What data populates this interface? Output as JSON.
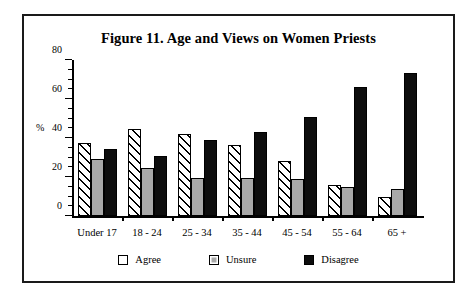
{
  "chart_data": {
    "type": "bar",
    "title": "Figure 11. Age and Views on Women Priests",
    "xlabel": "",
    "ylabel": "%",
    "ylim": [
      0,
      80
    ],
    "yticks": [
      0,
      20,
      40,
      60,
      80
    ],
    "ytick_labels": [
      "0",
      "20",
      "40",
      "60",
      "80"
    ],
    "grid": false,
    "legend_position": "bottom",
    "categories": [
      "Under 17",
      "18 - 24",
      "25 - 34",
      "35 - 44",
      "45 - 54",
      "55 - 64",
      "65 +"
    ],
    "series": [
      {
        "name": "Agree",
        "values": [
          37.5,
          44.5,
          42.0,
          36.5,
          28.0,
          16.0,
          9.5
        ]
      },
      {
        "name": "Unsure",
        "values": [
          29.0,
          24.5,
          19.5,
          19.5,
          19.0,
          15.0,
          14.0
        ]
      },
      {
        "name": "Disagree",
        "values": [
          34.5,
          31.0,
          39.0,
          43.0,
          51.0,
          66.0,
          73.5
        ]
      }
    ]
  },
  "legend": {
    "items": [
      {
        "label": "Agree",
        "swatch": "hatched-white"
      },
      {
        "label": "Unsure",
        "swatch": "gray"
      },
      {
        "label": "Disagree",
        "swatch": "black"
      }
    ]
  },
  "colors": {
    "agree": "#ffffff",
    "unsure": "#a8a8a8",
    "disagree": "#0d0d0d",
    "outline": "#000000",
    "frame": "#1a1a1a",
    "background": "#ffffff"
  }
}
